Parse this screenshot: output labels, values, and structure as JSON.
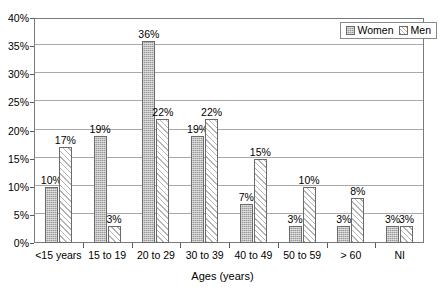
{
  "chart_data": {
    "type": "bar",
    "title": "",
    "xlabel": "Ages (years)",
    "ylabel": "",
    "categories": [
      "<15 years",
      "15 to 19",
      "20 to 29",
      "30 to 39",
      "40 to 49",
      "50 to 59",
      "> 60",
      "NI"
    ],
    "series": [
      {
        "name": "Women",
        "values": [
          10,
          19,
          36,
          19,
          7,
          3,
          3,
          3
        ],
        "labels": [
          "10%",
          "19%",
          "36%",
          "19%",
          "7%",
          "3%",
          "3%",
          "3%"
        ],
        "color": "#9a9a9a",
        "fill": "stippled-gray"
      },
      {
        "name": "Men",
        "values": [
          17,
          3,
          22,
          22,
          15,
          10,
          8,
          3
        ],
        "labels": [
          "17%",
          "3%",
          "22%",
          "22%",
          "15%",
          "10%",
          "8%",
          "3%"
        ],
        "color": "#ffffff",
        "fill": "diagonal-hatch"
      }
    ],
    "ylim": [
      0,
      40
    ],
    "ytick_values": [
      0,
      5,
      10,
      15,
      20,
      25,
      30,
      35,
      40
    ],
    "ytick_labels": [
      "0%",
      "5%",
      "10%",
      "15%",
      "20%",
      "25%",
      "30%",
      "35%",
      "40%"
    ],
    "grid": true,
    "grid_axis": "y",
    "legend_position": "top-right",
    "legend_entries": [
      "Women",
      "Men"
    ]
  },
  "legend": {
    "women_label": "Women",
    "men_label": "Men"
  },
  "axes": {
    "x_title": "Ages (years)"
  }
}
